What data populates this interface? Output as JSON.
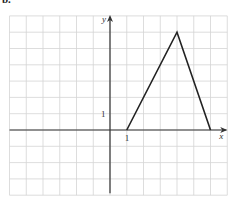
{
  "figure": {
    "label": "b."
  },
  "chart_data": {
    "type": "line",
    "title": "",
    "xlabel": "x",
    "ylabel": "y",
    "xlim": [
      -6,
      7
    ],
    "ylim": [
      -4,
      7
    ],
    "grid": true,
    "tick_labels": {
      "x": [
        {
          "value": 1,
          "label": "1"
        }
      ],
      "y": [
        {
          "value": 1,
          "label": "1"
        }
      ]
    },
    "series": [
      {
        "name": "triangle",
        "points": [
          [
            1,
            0
          ],
          [
            4,
            6
          ],
          [
            6,
            0
          ]
        ]
      }
    ],
    "axis_color": "#333333",
    "line_color": "#222222",
    "grid_color": "#d4d4d4"
  }
}
